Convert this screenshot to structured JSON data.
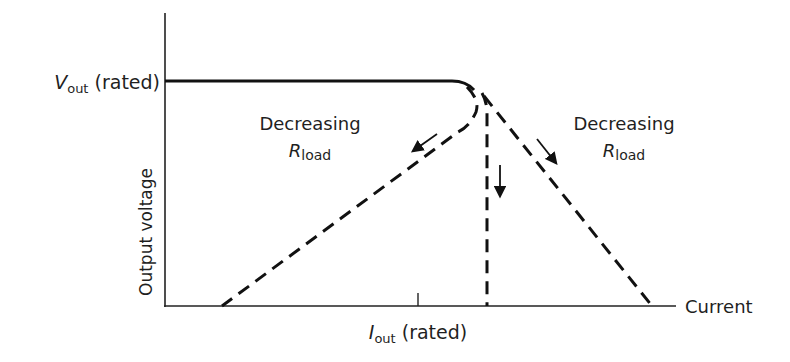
{
  "diagram": {
    "type": "power-supply-current-limit-characteristic",
    "axes": {
      "y_label": "Output voltage",
      "x_label": "Current",
      "y_tick_label": {
        "var": "V",
        "sub": "out",
        "suffix": " (rated)"
      },
      "x_tick_label": {
        "var": "I",
        "sub": "out",
        "suffix": " (rated)"
      }
    },
    "annotations": {
      "left": {
        "line1": "Decreasing",
        "var": "R",
        "sub": "load"
      },
      "right": {
        "line1": "Decreasing",
        "var": "R",
        "sub": "load"
      }
    },
    "curves": [
      {
        "name": "constant-voltage-region",
        "style": "solid"
      },
      {
        "name": "foldback-current-limit",
        "style": "dashed"
      },
      {
        "name": "constant-current-limit",
        "style": "dashed"
      },
      {
        "name": "soft-current-limit",
        "style": "dashed"
      }
    ],
    "colors": {
      "line": "#111111",
      "text": "#1f1f1f",
      "background": "#ffffff"
    }
  }
}
